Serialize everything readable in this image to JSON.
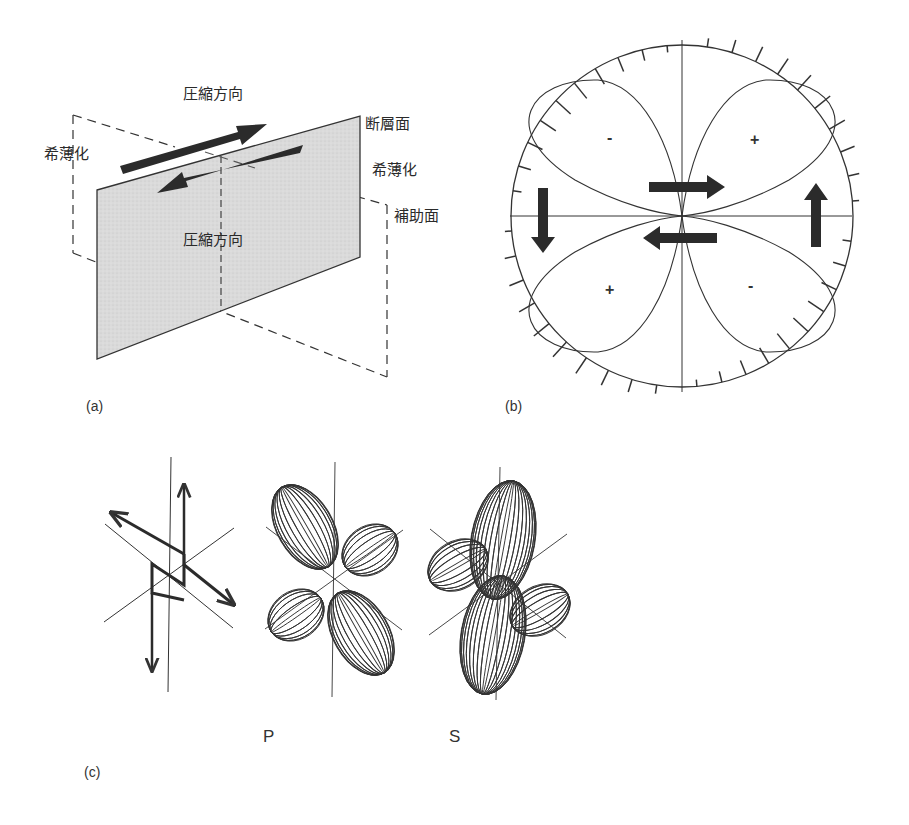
{
  "panel_a": {
    "label": "(a)",
    "compression_top": "圧縮方向",
    "compression_mid": "圧縮方向",
    "fault_plane": "断層面",
    "auxiliary_plane": "補助面",
    "dilatation_left": "希薄化",
    "dilatation_right": "希薄化"
  },
  "panel_b": {
    "label": "(b)",
    "quadrant_signs": {
      "upper_left": "-",
      "upper_right": "+",
      "lower_left": "+",
      "lower_right": "-"
    }
  },
  "panel_c": {
    "label": "(c)",
    "p_label": "P",
    "s_label": "S"
  },
  "colors": {
    "plane_fill": "#d9d9d9",
    "ink": "#2b2b2b",
    "arrow": "#333333"
  }
}
